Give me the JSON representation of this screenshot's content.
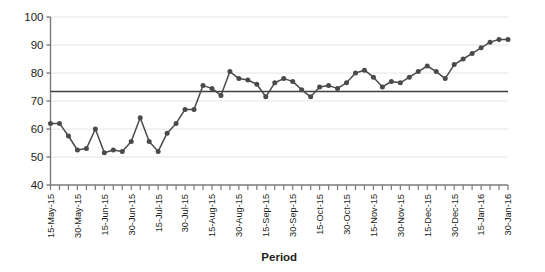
{
  "chart_data": {
    "type": "line",
    "title": "",
    "xlabel": "Period",
    "ylabel": "",
    "ylim": [
      40,
      100
    ],
    "yticks": [
      40,
      50,
      60,
      70,
      80,
      90,
      100
    ],
    "grid": true,
    "legend": false,
    "legend_position": "none",
    "series_color": "#4a4a4a",
    "mean_line_color": "#3f3f3f",
    "mean_line_value": 73.4,
    "annotations": [
      "Horizontal mean/centre line at approximately 73.4"
    ],
    "tick_label_interval": 3,
    "categories": [
      "15-May-15",
      "20-May-15",
      "25-May-15",
      "30-May-15",
      "04-Jun-15",
      "09-Jun-15",
      "15-Jun-15",
      "20-Jun-15",
      "25-Jun-15",
      "30-Jun-15",
      "05-Jul-15",
      "10-Jul-15",
      "15-Jul-15",
      "20-Jul-15",
      "25-Jul-15",
      "30-Jul-15",
      "04-Aug-15",
      "09-Aug-15",
      "15-Aug-15",
      "20-Aug-15",
      "25-Aug-15",
      "30-Aug-15",
      "04-Sep-15",
      "09-Sep-15",
      "15-Sep-15",
      "20-Sep-15",
      "25-Sep-15",
      "30-Sep-15",
      "05-Oct-15",
      "10-Oct-15",
      "15-Oct-15",
      "20-Oct-15",
      "25-Oct-15",
      "30-Oct-15",
      "04-Nov-15",
      "09-Nov-15",
      "15-Nov-15",
      "20-Nov-15",
      "25-Nov-15",
      "30-Nov-15",
      "05-Dec-15",
      "10-Dec-15",
      "15-Dec-15",
      "20-Dec-15",
      "25-Dec-15",
      "30-Dec-15",
      "04-Jan-16",
      "09-Jan-16",
      "15-Jan-16",
      "20-Jan-16",
      "25-Jan-16",
      "30-Jan-16"
    ],
    "tick_labels": [
      "15-May-15",
      "30-May-15",
      "15-Jun-15",
      "30-Jun-15",
      "15-Jul-15",
      "30-Jul-15",
      "15-Aug-15",
      "30-Aug-15",
      "15-Sep-15",
      "30-Sep-15",
      "15-Oct-15",
      "30-Oct-15",
      "15-Nov-15",
      "30-Nov-15",
      "15-Dec-15",
      "30-Dec-15",
      "15-Jan-16",
      "30-Jan-16"
    ],
    "values": [
      62.0,
      62.0,
      57.5,
      52.5,
      53.0,
      60.0,
      51.5,
      52.5,
      52.0,
      55.5,
      64.0,
      55.5,
      52.0,
      58.5,
      62.0,
      67.0,
      67.0,
      75.5,
      74.5,
      72.0,
      80.5,
      78.0,
      77.5,
      76.0,
      71.5,
      76.5,
      78.0,
      77.0,
      74.0,
      71.5,
      75.0,
      75.5,
      74.5,
      76.5,
      80.0,
      81.0,
      78.5,
      75.0,
      77.0,
      76.5,
      78.5,
      80.5,
      82.5,
      80.5,
      78.0,
      83.0,
      85.0,
      87.0,
      89.0,
      91.0,
      92.0,
      92.0
    ]
  }
}
